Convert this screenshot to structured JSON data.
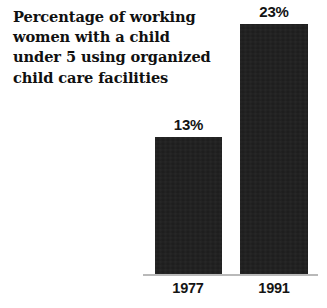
{
  "chart_data": {
    "type": "bar",
    "title": "Percentage of working women with a child under 5 using organized child care facilities",
    "title_lines": "Percentage of working\nwomen with a child\nunder 5 using organized\nchild care facilities",
    "categories": [
      "1977",
      "1991"
    ],
    "values": [
      13,
      23
    ],
    "value_labels": [
      "13%",
      "23%"
    ],
    "xlabel": "",
    "ylabel": "",
    "ylim": [
      0,
      23
    ],
    "grid": false,
    "legend": false,
    "unit": "%",
    "bar_color": "#1b1b1b",
    "axis_color": "#b9b9b9",
    "background_color": "#ffffff",
    "text_color": "#101010"
  }
}
